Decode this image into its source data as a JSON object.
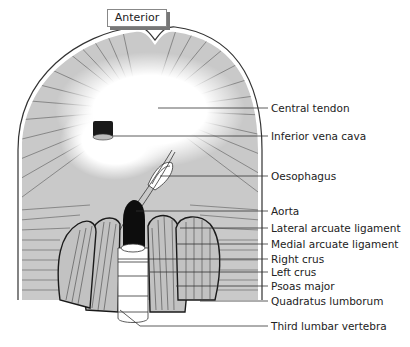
{
  "diagram": {
    "orientation_label": "Anterior",
    "labels": [
      {
        "id": "central-tendon",
        "text": "Central tendon",
        "y": 105
      },
      {
        "id": "inferior-vena-cava",
        "text": "Inferior vena cava",
        "y": 133
      },
      {
        "id": "oesophagus",
        "text": "Oesophagus",
        "y": 173
      },
      {
        "id": "aorta",
        "text": "Aorta",
        "y": 208
      },
      {
        "id": "lateral-arcuate-ligament",
        "text": "Lateral arcuate ligament",
        "y": 225
      },
      {
        "id": "medial-arcuate-ligament",
        "text": "Medial arcuate ligament",
        "y": 241
      },
      {
        "id": "right-crus",
        "text": "Right crus",
        "y": 256
      },
      {
        "id": "left-crus",
        "text": "Left crus",
        "y": 269
      },
      {
        "id": "psoas-major",
        "text": "Psoas major",
        "y": 283
      },
      {
        "id": "quadratus-lumborum",
        "text": "Quadratus lumborum",
        "y": 298
      },
      {
        "id": "third-lumbar-vertebra",
        "text": "Third lumbar vertebra",
        "y": 323
      }
    ],
    "colors": {
      "muscle": "#c8c8c8",
      "muscle_lines": "#555555",
      "tendon": "#ffffff",
      "vessel": "#111111",
      "leader": "#333333"
    }
  }
}
